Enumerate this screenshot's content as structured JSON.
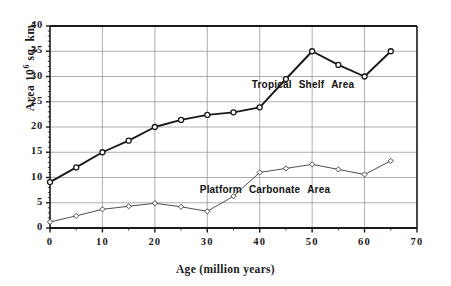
{
  "chart_data": {
    "type": "line",
    "title": "",
    "xlabel": "Age (million years)",
    "ylabel": "Area 10 sq. km.",
    "ylabel_base": "Area 10",
    "ylabel_exponent": "6",
    "ylabel_unit": " sq. km.",
    "xlim": [
      0,
      70
    ],
    "ylim": [
      0,
      40
    ],
    "xticks": [
      0,
      10,
      20,
      30,
      40,
      50,
      60,
      70
    ],
    "yticks": [
      0,
      5,
      10,
      15,
      20,
      25,
      30,
      35,
      40
    ],
    "xtick_labels": [
      "0",
      "10",
      "20",
      "30",
      "40",
      "50",
      "60",
      "70"
    ],
    "ytick_labels": [
      "0",
      "5",
      "10",
      "15",
      "20",
      "25",
      "30",
      "35",
      "40"
    ],
    "grid": true,
    "legend_position": "inline-annotation",
    "x": [
      0,
      5,
      10,
      15,
      20,
      25,
      30,
      35,
      40,
      45,
      50,
      55,
      60,
      65
    ],
    "series": [
      {
        "name": "Tropical Shelf Area",
        "annotation": "Tropical Shelf Area",
        "color": "#1a1a1a",
        "marker": "circle",
        "line_width": 1.9,
        "values": [
          9.1,
          12.0,
          15.0,
          17.3,
          20.0,
          21.4,
          22.4,
          22.9,
          23.9,
          29.5,
          35.0,
          32.3,
          30.0,
          35.0
        ]
      },
      {
        "name": "Platform Carbonate Area",
        "annotation": "Platform Carbonate Area",
        "color": "#3a3a3a",
        "marker": "diamond",
        "line_width": 0.9,
        "values": [
          1.2,
          2.4,
          3.7,
          4.3,
          4.9,
          4.2,
          3.3,
          6.3,
          11.0,
          11.8,
          12.6,
          11.6,
          10.6,
          13.3
        ]
      }
    ],
    "annotations": [
      {
        "text": "Tropical Shelf Area",
        "x_px": 303,
        "y_px": 85
      },
      {
        "text": "Platform Carbonate Area",
        "x_px": 265,
        "y_px": 190
      }
    ]
  },
  "colors": {
    "axis": "#1a1a1a",
    "grid": "#9a9a9a",
    "background": "#ffffff",
    "series_primary": "#1a1a1a",
    "series_secondary": "#3a3a3a"
  }
}
